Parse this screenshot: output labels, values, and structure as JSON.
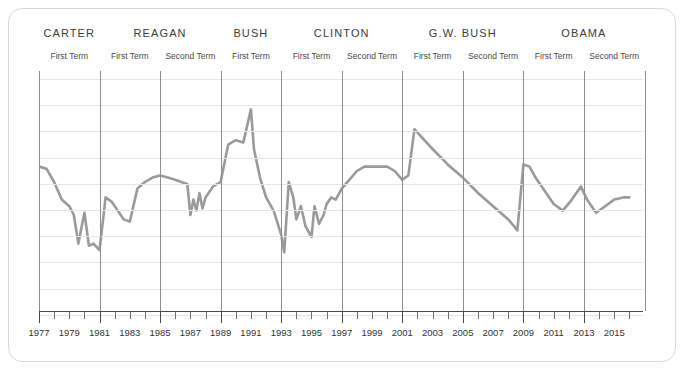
{
  "card": {
    "title": "presidential-terms-timeline"
  },
  "presidents": [
    {
      "name": "CARTER",
      "terms": [
        "First Term"
      ]
    },
    {
      "name": "REAGAN",
      "terms": [
        "First Term",
        "Second Term"
      ]
    },
    {
      "name": "BUSH",
      "terms": [
        "First Term"
      ]
    },
    {
      "name": "CLINTON",
      "terms": [
        "First Term",
        "Second Term"
      ]
    },
    {
      "name": "G.W. BUSH",
      "terms": [
        "First Term",
        "Second Term"
      ]
    },
    {
      "name": "OBAMA",
      "terms": [
        "First Term",
        "Second Term"
      ]
    }
  ],
  "axis": {
    "labels": [
      "1977",
      "1979",
      "1981",
      "1983",
      "1985",
      "1987",
      "1989",
      "1991",
      "1993",
      "1995",
      "1997",
      "1999",
      "2001",
      "2003",
      "2005",
      "2007",
      "2009",
      "2011",
      "2013",
      "2015"
    ]
  },
  "colors": {
    "line": "#9a9a9a",
    "grid": "#e6e6e6",
    "term_divider": "#8f8f8f",
    "axis": "#4a4a4a",
    "card_border": "#d9d9d9",
    "text": "#3c3c3c"
  },
  "chart_data": {
    "type": "line",
    "title": "",
    "subtitle": "",
    "xlabel": "",
    "ylabel": "",
    "grid": true,
    "legend": false,
    "xlim": [
      1977,
      2016
    ],
    "ylim": [
      0,
      100
    ],
    "tick_labels": [
      "1977",
      "1979",
      "1981",
      "1983",
      "1985",
      "1987",
      "1989",
      "1991",
      "1993",
      "1995",
      "1997",
      "1999",
      "2001",
      "2003",
      "2005",
      "2007",
      "2009",
      "2011",
      "2013",
      "2015"
    ],
    "term_boundaries": [
      1977,
      1981,
      1985,
      1989,
      1993,
      1997,
      2001,
      2005,
      2009,
      2013,
      2017
    ],
    "annotations": [
      {
        "text": "CARTER",
        "span": [
          1977,
          1981
        ]
      },
      {
        "text": "REAGAN",
        "span": [
          1981,
          1989
        ]
      },
      {
        "text": "BUSH",
        "span": [
          1989,
          1993
        ]
      },
      {
        "text": "CLINTON",
        "span": [
          1993,
          2001
        ]
      },
      {
        "text": "G.W. BUSH",
        "span": [
          2001,
          2009
        ]
      },
      {
        "text": "OBAMA",
        "span": [
          2009,
          2017
        ]
      }
    ],
    "series": [
      {
        "name": "approval",
        "x": [
          1977.0,
          1977.5,
          1978.0,
          1978.5,
          1979.0,
          1979.3,
          1979.6,
          1980.0,
          1980.3,
          1980.6,
          1981.0,
          1981.4,
          1981.8,
          1982.2,
          1982.6,
          1983.0,
          1983.5,
          1984.0,
          1984.5,
          1985.0,
          1985.5,
          1986.0,
          1986.4,
          1986.8,
          1987.0,
          1987.2,
          1987.4,
          1987.6,
          1987.8,
          1988.0,
          1988.5,
          1989.0,
          1989.5,
          1990.0,
          1990.5,
          1991.0,
          1991.2,
          1991.6,
          1992.0,
          1992.5,
          1993.0,
          1993.2,
          1993.5,
          1993.8,
          1994.0,
          1994.3,
          1994.6,
          1995.0,
          1995.2,
          1995.5,
          1995.8,
          1996.0,
          1996.3,
          1996.6,
          1997.0,
          1997.5,
          1998.0,
          1998.5,
          1999.0,
          1999.5,
          2000.0,
          2000.5,
          2001.0,
          2001.4,
          2001.8,
          2002.2,
          2003.0,
          2004.0,
          2005.0,
          2006.0,
          2007.0,
          2008.0,
          2008.6,
          2009.0,
          2009.4,
          2009.8,
          2010.4,
          2011.0,
          2011.6,
          2012.2,
          2012.8,
          2013.2,
          2013.8,
          2014.4,
          2015.0,
          2015.6,
          2016.0
        ],
        "y": [
          62,
          61,
          55,
          47,
          44,
          40,
          27,
          41,
          26,
          27,
          24,
          48,
          46,
          42,
          38,
          37,
          52,
          55,
          57,
          58,
          57,
          56,
          55,
          54,
          40,
          47,
          42,
          50,
          43,
          48,
          53,
          55,
          72,
          74,
          73,
          88,
          70,
          57,
          48,
          42,
          31,
          23,
          55,
          48,
          38,
          44,
          35,
          30,
          44,
          36,
          40,
          45,
          48,
          47,
          52,
          56,
          60,
          62,
          62,
          62,
          62,
          60,
          56,
          58,
          79,
          76,
          70,
          63,
          57,
          50,
          44,
          38,
          33,
          63,
          62,
          57,
          51,
          45,
          42,
          47,
          53,
          47,
          41,
          44,
          47,
          48,
          48
        ]
      }
    ]
  }
}
